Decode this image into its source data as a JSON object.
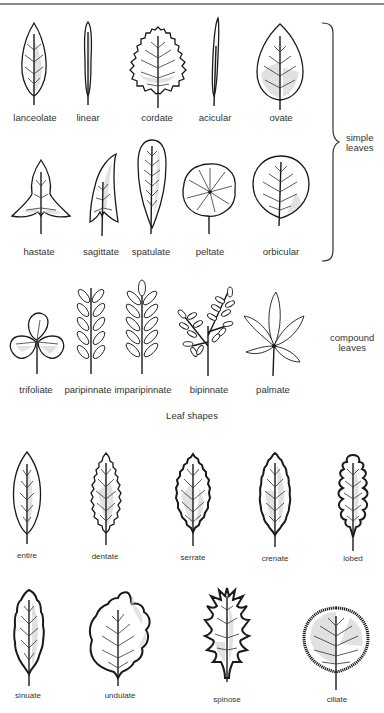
{
  "figure": {
    "caption": "Leaf shapes",
    "groups": {
      "simple": "simple\nleaves",
      "simple_line1": "simple",
      "simple_line2": "leaves",
      "compound_line1": "compound",
      "compound_line2": "leaves"
    },
    "simple_row1": [
      {
        "label": "lanceolate"
      },
      {
        "label": "linear"
      },
      {
        "label": "cordate"
      },
      {
        "label": "acicular"
      },
      {
        "label": "ovate"
      }
    ],
    "simple_row2": [
      {
        "label": "hastate"
      },
      {
        "label": "sagittate"
      },
      {
        "label": "spatulate"
      },
      {
        "label": "peltate"
      },
      {
        "label": "orbicular"
      }
    ],
    "compound_row": [
      {
        "label": "trifoliate"
      },
      {
        "label": "paripinnate"
      },
      {
        "label": "imparipinnate"
      },
      {
        "label": "bipinnate"
      },
      {
        "label": "palmate"
      }
    ],
    "margins_row1": [
      {
        "label": "entire"
      },
      {
        "label": "dentate"
      },
      {
        "label": "serrate"
      },
      {
        "label": "crenate"
      },
      {
        "label": "lobed"
      }
    ],
    "margins_row2": [
      {
        "label": "sinuate"
      },
      {
        "label": "undulate"
      },
      {
        "label": "spinose"
      },
      {
        "label": "ciliate"
      }
    ]
  }
}
